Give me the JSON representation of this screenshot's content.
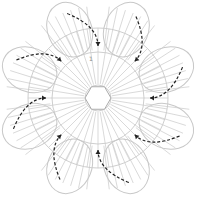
{
  "diagram": {
    "type": "crochet-chart",
    "center": [
      98,
      98
    ],
    "petal_count": 8,
    "rings": [
      {
        "name": "foundation-ring",
        "radius": 13
      },
      {
        "name": "round-2",
        "radius": 46
      },
      {
        "name": "round-3",
        "radius": 70
      }
    ],
    "stitch_color": "#c8c8c8",
    "arrow_color": "#222222",
    "round_label": "1",
    "arrow_positions_deg": [
      -90,
      -45,
      0,
      45,
      90,
      135,
      180,
      225
    ]
  }
}
